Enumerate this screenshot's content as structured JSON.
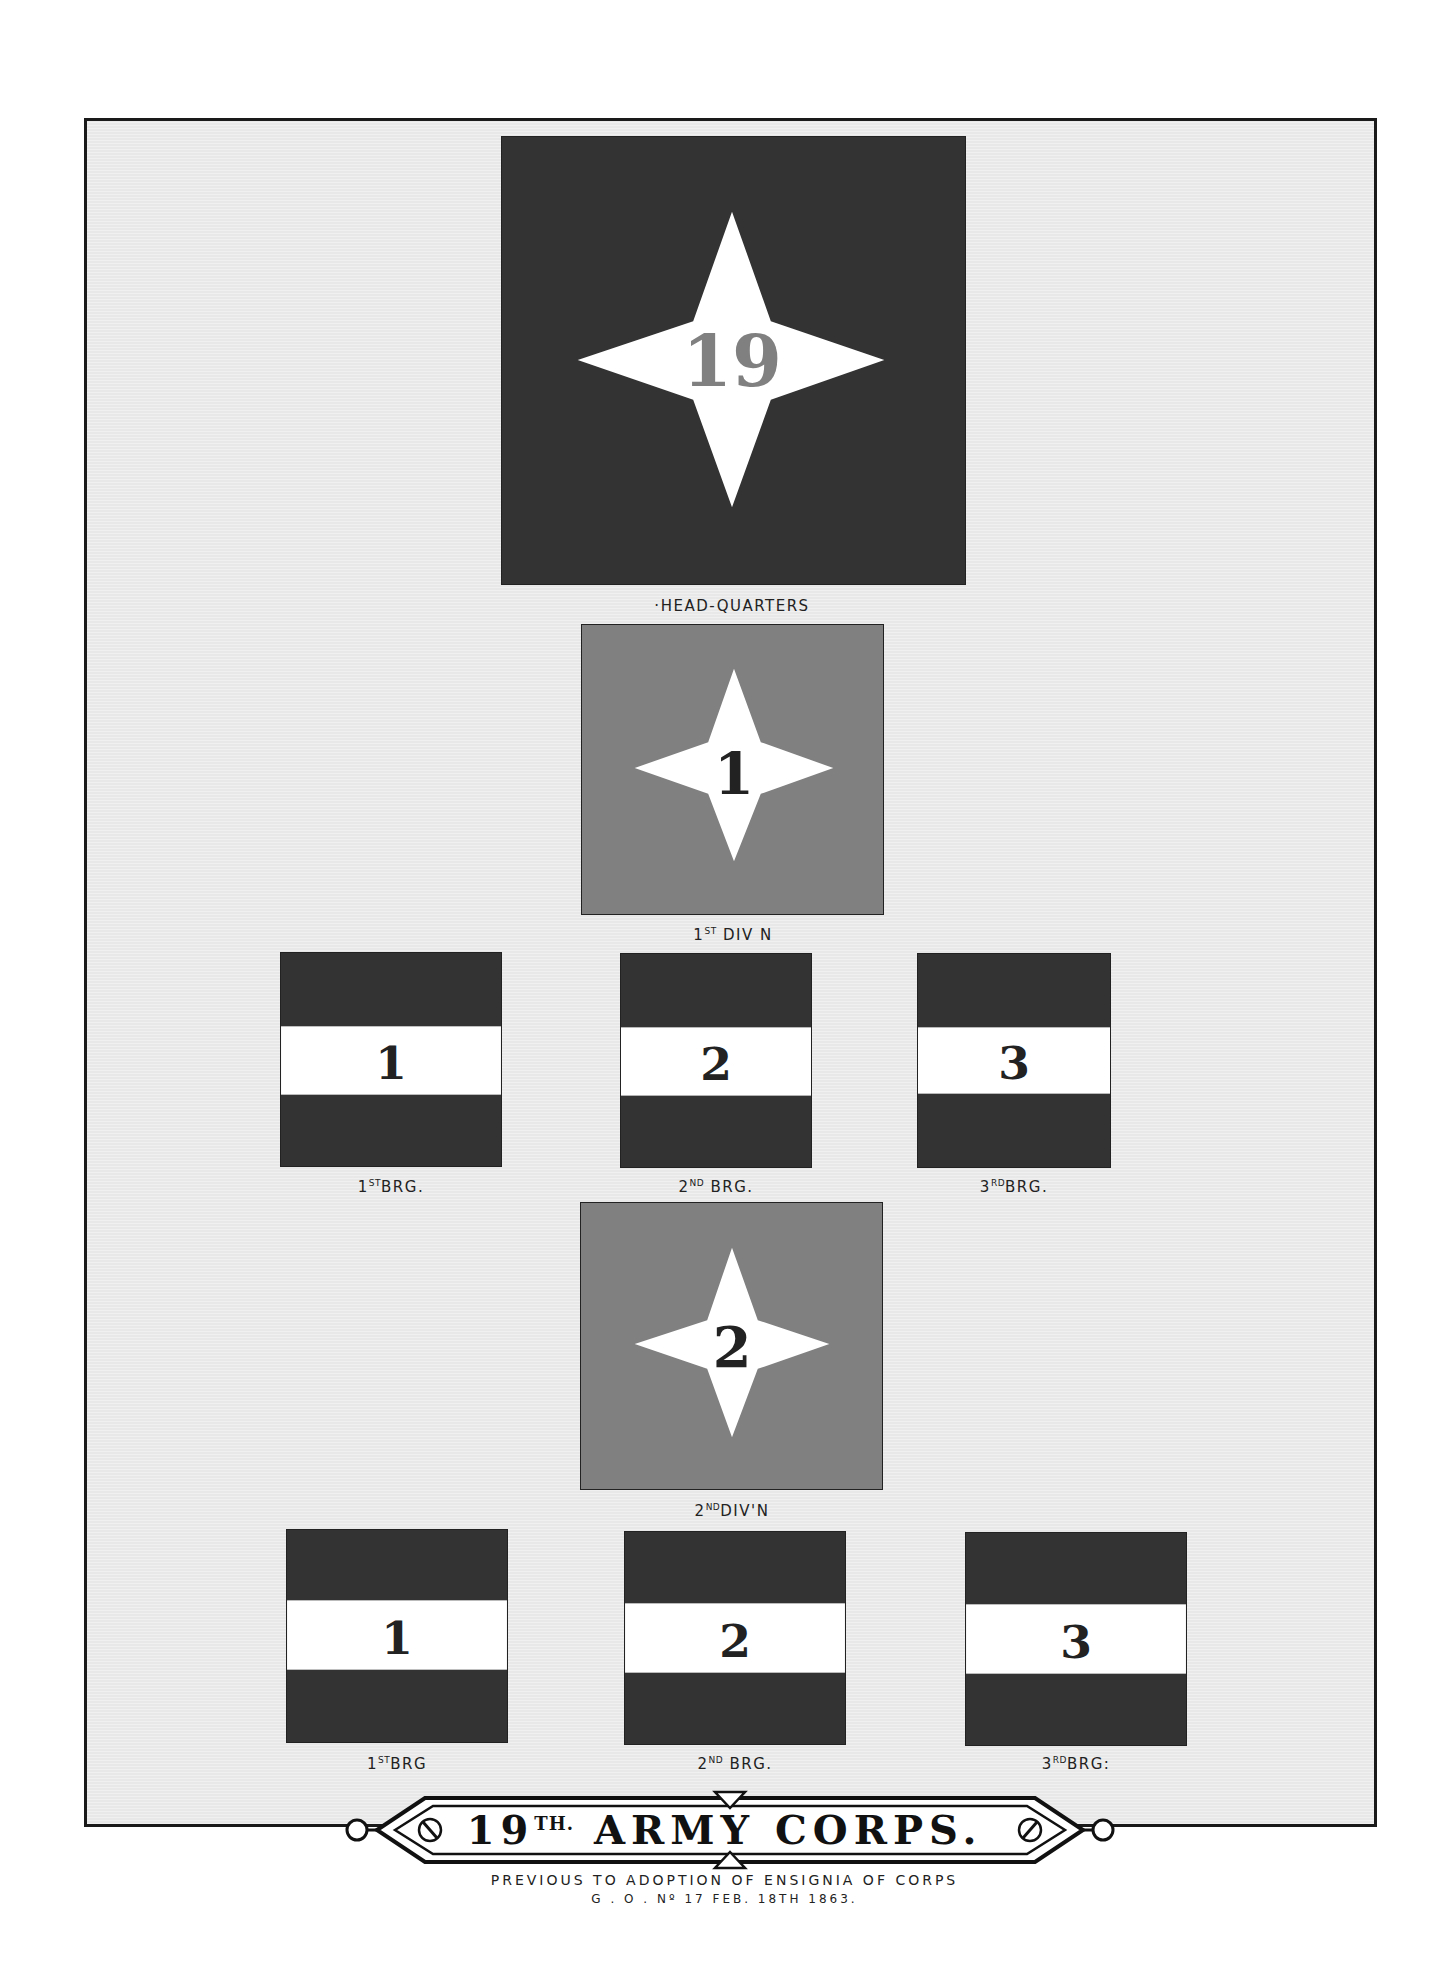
{
  "plate": {
    "title_main": "19",
    "title_sup": "TH.",
    "title_rest": "ARMY CORPS.",
    "subtitle_line1": "PREVIOUS TO ADOPTION OF ENSIGNIA OF CORPS",
    "subtitle_line2": "G . O . Nº 17 FEB. 18TH 1863."
  },
  "colors": {
    "dark": "#333333",
    "medium": "#808080",
    "white": "#ffffff",
    "background": "#e8e8e8"
  },
  "flags": {
    "headquarters": {
      "number": "19",
      "label": "·HEAD-QUARTERS",
      "annotation": "4'"
    },
    "div1": {
      "number": "1",
      "label_num": "1",
      "label_sup": "ST",
      "label_rest": " DIV N",
      "annotation": "4'"
    },
    "div1_brigades": [
      {
        "number": "1",
        "label_num": "1",
        "label_sup": "ST",
        "label_rest": "BRG.",
        "annotation": "4'"
      },
      {
        "number": "2",
        "label_num": "2",
        "label_sup": "ND",
        "label_rest": " BRG."
      },
      {
        "number": "3",
        "label_num": "3",
        "label_sup": "RD",
        "label_rest": "BRG."
      }
    ],
    "div2": {
      "number": "2",
      "label_num": "2",
      "label_sup": "ND",
      "label_rest": "DIV'N"
    },
    "div2_brigades": [
      {
        "number": "1",
        "label_num": "1",
        "label_sup": "ST",
        "label_rest": "BRG"
      },
      {
        "number": "2",
        "label_num": "2",
        "label_sup": "ND",
        "label_rest": " BRG."
      },
      {
        "number": "3",
        "label_num": "3",
        "label_sup": "RD",
        "label_rest": "BRG:"
      }
    ]
  }
}
